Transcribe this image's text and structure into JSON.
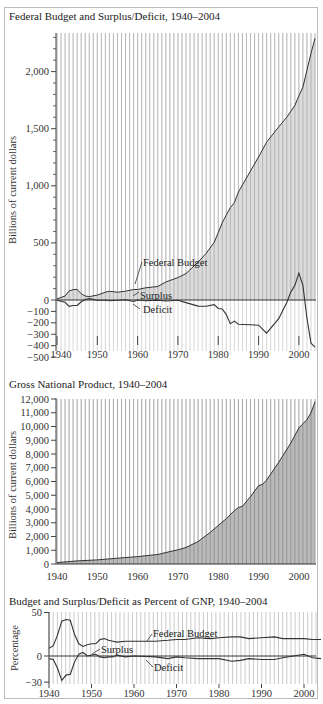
{
  "charts": {
    "budget": {
      "title": "Federal Budget and Surplus/Deficit, 1940–2004",
      "ylabel": "Billions of current dollars",
      "yticks": [
        "2,000",
        "1,500",
        "1,000",
        "500",
        "0",
        "−100",
        "−200",
        "−300",
        "−400",
        "−500"
      ],
      "xticks": [
        "1940",
        "1950",
        "1960",
        "1970",
        "1980",
        "1990",
        "2000"
      ],
      "labels": {
        "budget": "Federal Budget",
        "surplus": "Surplus",
        "deficit": "Deficit"
      }
    },
    "gnp": {
      "title": "Gross National Product, 1940–2004",
      "ylabel": "Billions of current dollars",
      "yticks": [
        "12,000",
        "11,000",
        "10,000",
        "9,000",
        "8,000",
        "7,000",
        "6,000",
        "5,000",
        "4,000",
        "3,000",
        "2,000",
        "1,000",
        "0"
      ],
      "xticks": [
        "1940",
        "1950",
        "1960",
        "1970",
        "1980",
        "1990",
        "2000"
      ]
    },
    "percent": {
      "title": "Budget and Surplus/Deficit as Percent of GNP, 1940–2004",
      "ylabel": "Percentage",
      "yticks": [
        "50",
        "0",
        "−30"
      ],
      "xticks": [
        "1940",
        "1950",
        "1960",
        "1970",
        "1980",
        "1990",
        "2000"
      ],
      "labels": {
        "budget": "Federal Budget",
        "surplus": "Surplus",
        "deficit": "Deficit"
      }
    }
  },
  "chart_data": [
    {
      "type": "area",
      "title": "Federal Budget and Surplus/Deficit, 1940–2004",
      "xlabel": "",
      "ylabel": "Billions of current dollars",
      "ylim": [
        -500,
        2300
      ],
      "grid": "vertical",
      "x": [
        1940,
        1942,
        1943,
        1944,
        1945,
        1946,
        1947,
        1948,
        1950,
        1952,
        1953,
        1955,
        1957,
        1959,
        1960,
        1962,
        1965,
        1967,
        1970,
        1972,
        1975,
        1977,
        1979,
        1980,
        1981,
        1982,
        1983,
        1984,
        1985,
        1990,
        1992,
        1995,
        1997,
        1998,
        1999,
        2000,
        2001,
        2002,
        2003,
        2004
      ],
      "series": [
        {
          "name": "Federal Budget",
          "values": [
            10,
            35,
            79,
            91,
            93,
            55,
            35,
            30,
            43,
            68,
            76,
            68,
            77,
            92,
            92,
            107,
            118,
            158,
            196,
            231,
            332,
            409,
            504,
            591,
            678,
            745,
            808,
            852,
            946,
            1253,
            1382,
            1516,
            1601,
            1652,
            1702,
            1789,
            1863,
            2011,
            2160,
            2292
          ]
        },
        {
          "name": "Surplus/Deficit",
          "values": [
            -3,
            -20,
            -55,
            -48,
            -48,
            -16,
            4,
            12,
            -3,
            -2,
            -6,
            -3,
            3,
            -13,
            0,
            -7,
            -1,
            -9,
            -3,
            -23,
            -53,
            -54,
            -41,
            -74,
            -79,
            -128,
            -208,
            -185,
            -212,
            -221,
            -290,
            -164,
            -22,
            69,
            126,
            236,
            128,
            -158,
            -378,
            -413
          ]
        }
      ],
      "annotations": [
        "Federal Budget",
        "Surplus",
        "Deficit"
      ]
    },
    {
      "type": "area",
      "title": "Gross National Product, 1940–2004",
      "xlabel": "",
      "ylabel": "Billions of current dollars",
      "ylim": [
        0,
        12000
      ],
      "grid": "vertical",
      "x": [
        1940,
        1945,
        1950,
        1955,
        1960,
        1965,
        1968,
        1970,
        1972,
        1975,
        1978,
        1980,
        1982,
        1984,
        1985,
        1986,
        1988,
        1990,
        1991,
        1992,
        1995,
        1998,
        2000,
        2001,
        2002,
        2003,
        2004
      ],
      "series": [
        {
          "name": "GNP",
          "values": [
            100,
            225,
            300,
            420,
            540,
            690,
            900,
            1030,
            1200,
            1640,
            2300,
            2800,
            3300,
            3880,
            4100,
            4200,
            4900,
            5700,
            5800,
            6100,
            7400,
            8800,
            9900,
            10200,
            10500,
            11000,
            11800
          ]
        }
      ]
    },
    {
      "type": "line",
      "title": "Budget and Surplus/Deficit as Percent of GNP, 1940–2004",
      "xlabel": "",
      "ylabel": "Percentage",
      "ylim": [
        -30,
        50
      ],
      "grid": "vertical",
      "x": [
        1940,
        1941,
        1942,
        1943,
        1944,
        1945,
        1946,
        1947,
        1948,
        1949,
        1950,
        1951,
        1952,
        1953,
        1954,
        1955,
        1956,
        1958,
        1960,
        1965,
        1968,
        1970,
        1972,
        1975,
        1978,
        1980,
        1983,
        1985,
        1987,
        1990,
        1993,
        1995,
        2000,
        2002,
        2004
      ],
      "series": [
        {
          "name": "Federal Budget",
          "values": [
            9,
            12,
            24,
            40,
            42,
            41,
            25,
            14,
            11,
            13,
            14,
            14,
            19,
            20,
            18,
            17,
            16,
            17,
            17,
            17,
            18,
            19,
            19,
            21,
            20,
            21,
            22,
            22,
            20,
            21,
            22,
            20,
            20,
            19,
            19
          ]
        },
        {
          "name": "Surplus/Deficit",
          "values": [
            -3,
            -4,
            -14,
            -28,
            -22,
            -21,
            -7,
            2,
            4,
            0,
            1,
            2,
            -1,
            -2,
            -1,
            -1,
            1,
            -1,
            0,
            -1,
            -3,
            -1,
            -2,
            -3,
            -3,
            -3,
            -6,
            -5,
            -3,
            -4,
            -4,
            -2,
            2,
            -2,
            -3
          ]
        }
      ],
      "annotations": [
        "Federal Budget",
        "Surplus",
        "Deficit"
      ]
    }
  ]
}
